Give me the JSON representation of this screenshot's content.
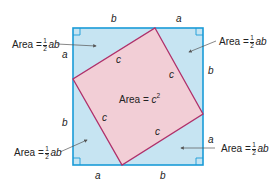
{
  "diagram": {
    "colors": {
      "outer_fill": "#c6e4f2",
      "outer_stroke": "#1a9bd7",
      "inner_fill": "#f2ced6",
      "inner_stroke": "#b0306a",
      "text": "#222222",
      "arrow": "#555555"
    },
    "outer_square": {
      "x": 73,
      "y": 28,
      "size": 130
    },
    "inner_square_vertices": [
      [
        155,
        28
      ],
      [
        203,
        114
      ],
      [
        122,
        165
      ],
      [
        73,
        79
      ]
    ],
    "side_labels": {
      "top_left": "b",
      "top_right": "a",
      "left_top": "a",
      "left_bottom": "b",
      "right_top": "b",
      "right_bottom": "a",
      "bottom_left": "a",
      "bottom_right": "b"
    },
    "hypotenuse_labels": [
      "c",
      "c",
      "c",
      "c"
    ],
    "triangle_area": {
      "prefix": "Area = ",
      "frac_num": "1",
      "frac_den": "2",
      "suffix": "ab"
    },
    "center_area": {
      "prefix": "Area = ",
      "var": "c",
      "exp": "2"
    }
  }
}
